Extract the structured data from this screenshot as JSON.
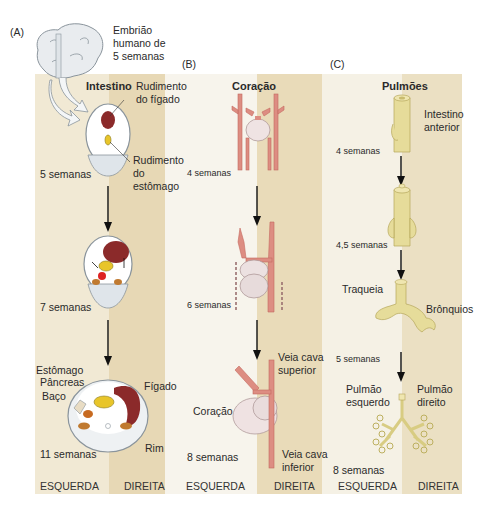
{
  "figure": {
    "panel_labels": [
      "(A)",
      "(B)",
      "(C)"
    ],
    "embryo_caption": [
      "Embrião",
      "humano de",
      "5 semanas"
    ],
    "colors": {
      "bg_left": "#f3ecd9",
      "bg_right": "#e8dab8",
      "bg_white": "#f6f3ea",
      "liver": "#8b2a2a",
      "stomach": "#e8c52a",
      "pancreas": "#c76a20",
      "vessel": "#d9837a",
      "heart": "#ecdede",
      "lung": "#e6dc9a"
    }
  },
  "panel_a": {
    "title": "Intestino",
    "labels": {
      "liver_rudiment": [
        "Rudimento",
        "do fígado"
      ],
      "stomach_rudiment": [
        "Rudimento",
        "do",
        "estômago"
      ],
      "stomach": "Estômago",
      "pancreas": "Pâncreas",
      "spleen": "Baço",
      "liver": "Fígado",
      "kidney": "Rim"
    },
    "stages": [
      "5 semanas",
      "7 semanas",
      "11 semanas"
    ]
  },
  "panel_b": {
    "title": "Coração",
    "labels": {
      "svc": [
        "Veia cava",
        "superior"
      ],
      "heart": "Coração",
      "ivc": [
        "Veia cava",
        "inferior"
      ]
    },
    "stages": [
      "4 semanas",
      "6 semanas",
      "8 semanas"
    ]
  },
  "panel_c": {
    "title": "Pulmões",
    "labels": {
      "foregut": [
        "Intestino",
        "anterior"
      ],
      "trachea": "Traqueia",
      "bronchi": "Brônquios",
      "left_lung": [
        "Pulmão",
        "esquerdo"
      ],
      "right_lung": [
        "Pulmão",
        "direito"
      ]
    },
    "stages": [
      "4 semanas",
      "4,5 semanas",
      "5 semanas",
      "8 semanas"
    ]
  },
  "sides": {
    "left": "ESQUERDA",
    "right": "DIREITA"
  }
}
